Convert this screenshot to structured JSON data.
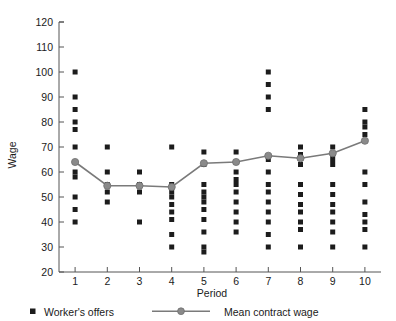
{
  "chart_data": {
    "type": "scatter",
    "title": "",
    "xlabel": "Period",
    "ylabel": "Wage",
    "xlim": [
      0.5,
      10.5
    ],
    "ylim": [
      20,
      120
    ],
    "ytick_values": [
      20,
      30,
      40,
      50,
      60,
      70,
      80,
      90,
      100,
      110,
      120
    ],
    "ytick_labels": [
      "20",
      "30",
      "40",
      "50",
      "60",
      "70",
      "80",
      "90",
      "100",
      "110",
      "120"
    ],
    "xtick_values": [
      1,
      2,
      3,
      4,
      5,
      6,
      7,
      8,
      9,
      10
    ],
    "xtick_labels": [
      "1",
      "2",
      "3",
      "4",
      "5",
      "6",
      "7",
      "8",
      "9",
      "10"
    ],
    "grid": false,
    "legend_position": "below-axis",
    "categories": [
      "1",
      "2",
      "3",
      "4",
      "5",
      "6",
      "7",
      "8",
      "9",
      "10"
    ],
    "series": [
      {
        "name": "Worker's offers",
        "type": "scatter",
        "marker": "square",
        "color": "#1c1c1c",
        "points": [
          {
            "x": 1,
            "y": [
              100,
              90,
              85,
              80,
              77,
              70,
              60,
              58,
              50,
              45,
              40
            ]
          },
          {
            "x": 2,
            "y": [
              70,
              60,
              55,
              52,
              48
            ]
          },
          {
            "x": 3,
            "y": [
              60,
              55,
              52,
              40
            ]
          },
          {
            "x": 4,
            "y": [
              70,
              55,
              52,
              50,
              47,
              44,
              41,
              35,
              30
            ]
          },
          {
            "x": 5,
            "y": [
              68,
              63,
              55,
              52,
              50,
              48,
              45,
              41,
              36,
              30,
              28
            ]
          },
          {
            "x": 6,
            "y": [
              68,
              64,
              60,
              57,
              55,
              52,
              48,
              44,
              40,
              36
            ]
          },
          {
            "x": 7,
            "y": [
              100,
              95,
              90,
              85,
              65,
              60,
              55,
              52,
              48,
              44,
              40,
              35,
              30
            ]
          },
          {
            "x": 8,
            "y": [
              70,
              67,
              63,
              55,
              51,
              47,
              44,
              40,
              37,
              30
            ]
          },
          {
            "x": 9,
            "y": [
              70,
              67,
              65,
              63,
              55,
              51,
              47,
              44,
              40,
              36,
              30
            ]
          },
          {
            "x": 10,
            "y": [
              85,
              80,
              78,
              75,
              60,
              55,
              48,
              43,
              40,
              37,
              30
            ]
          }
        ]
      },
      {
        "name": "Mean contract wage",
        "type": "line",
        "marker": "circle",
        "color": "#8a8a8a",
        "x": [
          1,
          2,
          3,
          4,
          5,
          6,
          7,
          8,
          9,
          10
        ],
        "values": [
          64,
          54.5,
          54.5,
          54,
          63.5,
          64,
          66.5,
          65.5,
          67.5,
          72.5
        ]
      }
    ]
  },
  "legend": {
    "items": [
      {
        "label": "Worker's offers",
        "marker": "square",
        "color": "#1c1c1c"
      },
      {
        "label": "Mean contract wage",
        "marker": "line-circle",
        "color": "#8a8a8a"
      }
    ]
  },
  "axes": {
    "x_title": "Period",
    "y_title": "Wage"
  }
}
